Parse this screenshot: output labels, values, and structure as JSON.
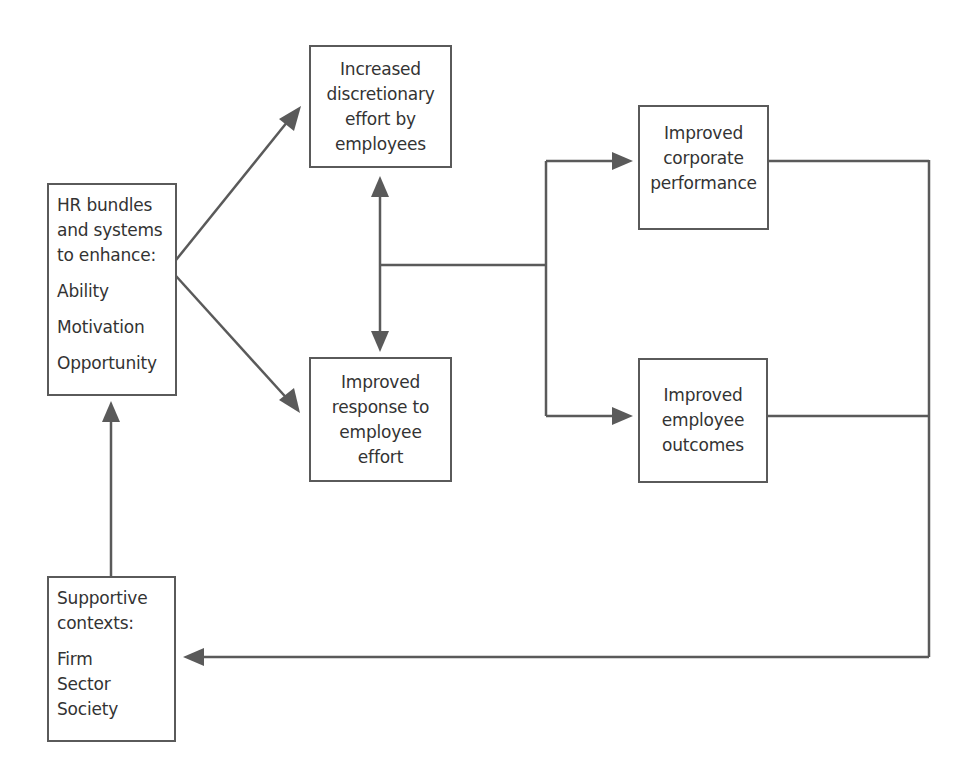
{
  "diagram": {
    "colors": {
      "line": "#5a5a5a",
      "text": "#333333",
      "background": "#ffffff"
    },
    "nodes": {
      "hr_bundles": {
        "heading_lines": [
          "HR bundles",
          "and systems",
          "to enhance:"
        ],
        "items": [
          "Ability",
          "Motivation",
          "Opportunity"
        ]
      },
      "discretionary_effort": {
        "lines": [
          "Increased",
          "discretionary",
          "effort by",
          "employees"
        ]
      },
      "response_to_effort": {
        "lines": [
          "Improved",
          "response to",
          "employee",
          "effort"
        ]
      },
      "corporate_performance": {
        "lines": [
          "Improved",
          "corporate",
          "performance"
        ]
      },
      "employee_outcomes": {
        "lines": [
          "Improved",
          "employee",
          "outcomes"
        ]
      },
      "supportive_contexts": {
        "heading_lines": [
          "Supportive",
          "contexts:"
        ],
        "items": [
          "Firm",
          "Sector",
          "Society"
        ]
      }
    },
    "edges": [
      {
        "from": "hr_bundles",
        "to": "discretionary_effort",
        "type": "arrow"
      },
      {
        "from": "hr_bundles",
        "to": "response_to_effort",
        "type": "arrow"
      },
      {
        "from": "discretionary_effort",
        "to": "response_to_effort",
        "type": "double-arrow"
      },
      {
        "from": "discretionary_effort/response_to_effort",
        "to": "corporate_performance",
        "type": "arrow"
      },
      {
        "from": "discretionary_effort/response_to_effort",
        "to": "employee_outcomes",
        "type": "arrow"
      },
      {
        "from": "corporate_performance/employee_outcomes",
        "to": "supportive_contexts",
        "type": "arrow"
      },
      {
        "from": "supportive_contexts",
        "to": "hr_bundles",
        "type": "arrow"
      }
    ]
  }
}
